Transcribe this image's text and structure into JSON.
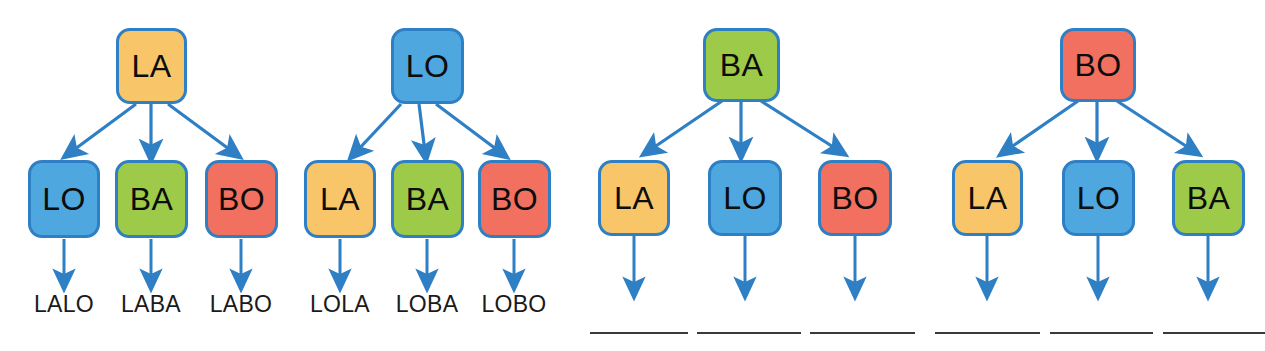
{
  "page": {
    "width": 1265,
    "height": 351,
    "background": "#ffffff"
  },
  "palette": {
    "orange": "#F8C669",
    "blue": "#4FA7E0",
    "green": "#9DCA48",
    "red": "#F2705F",
    "node_border": "#2E7FC4",
    "arrow": "#2E7FC4",
    "text": "#0d0d0d",
    "answer_line": "#3a3a3a"
  },
  "trees": [
    {
      "id": "tree-la",
      "root": {
        "label": "LA",
        "color": "orange"
      },
      "children": [
        {
          "label": "LO",
          "color": "blue",
          "result": "LALO",
          "result_blank": false
        },
        {
          "label": "BA",
          "color": "green",
          "result": "LABA",
          "result_blank": false
        },
        {
          "label": "BO",
          "color": "red",
          "result": "LABO",
          "result_blank": false
        }
      ]
    },
    {
      "id": "tree-lo",
      "root": {
        "label": "LO",
        "color": "blue"
      },
      "children": [
        {
          "label": "LA",
          "color": "orange",
          "result": "LOLA",
          "result_blank": false
        },
        {
          "label": "BA",
          "color": "green",
          "result": "LOBA",
          "result_blank": false
        },
        {
          "label": "BO",
          "color": "red",
          "result": "LOBO",
          "result_blank": false
        }
      ]
    },
    {
      "id": "tree-ba",
      "root": {
        "label": "BA",
        "color": "green"
      },
      "children": [
        {
          "label": "LA",
          "color": "orange",
          "result": "",
          "result_blank": true
        },
        {
          "label": "LO",
          "color": "blue",
          "result": "",
          "result_blank": true
        },
        {
          "label": "BO",
          "color": "red",
          "result": "",
          "result_blank": true
        }
      ]
    },
    {
      "id": "tree-bo",
      "root": {
        "label": "BO",
        "color": "red"
      },
      "children": [
        {
          "label": "LA",
          "color": "orange",
          "result": "",
          "result_blank": true
        },
        {
          "label": "LO",
          "color": "blue",
          "result": "",
          "result_blank": true
        },
        {
          "label": "BA",
          "color": "green",
          "result": "",
          "result_blank": true
        }
      ]
    }
  ]
}
